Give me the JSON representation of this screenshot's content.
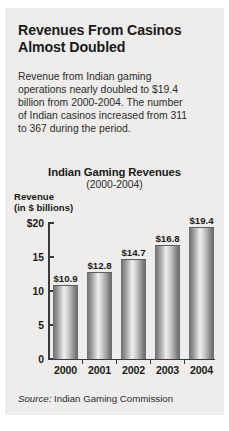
{
  "card": {
    "background_color": "#eeedec"
  },
  "headline": {
    "lines": [
      "Revenues From Casinos",
      "Almost Doubled"
    ]
  },
  "deck": {
    "lines": [
      "Revenue from Indian gaming",
      "operations nearly doubled to $19.4",
      "billion from 2000-2004. The number",
      "of Indian casinos increased from 311",
      "to 367 during the period."
    ]
  },
  "source": {
    "label": "Source:",
    "text": "Indian Gaming Commission"
  },
  "chart_data": {
    "type": "bar",
    "title": "Indian Gaming Revenues",
    "subtitle": "(2000-2004)",
    "ylabel_lines": [
      "Revenue",
      "(in $ billions)"
    ],
    "xlabel": "",
    "categories": [
      "2000",
      "2001",
      "2002",
      "2003",
      "2004"
    ],
    "values": [
      10.9,
      12.8,
      14.7,
      16.8,
      19.4
    ],
    "value_labels": [
      "$10.9",
      "$12.8",
      "$14.7",
      "$16.8",
      "$19.4"
    ],
    "ytick_values": [
      20,
      15,
      10,
      5,
      0
    ],
    "ytick_labels": [
      "$20",
      "15",
      "10",
      "5",
      "0"
    ],
    "ylim": [
      0,
      20
    ],
    "grid": false,
    "legend": null,
    "bar_color": "#9a9a9a"
  }
}
